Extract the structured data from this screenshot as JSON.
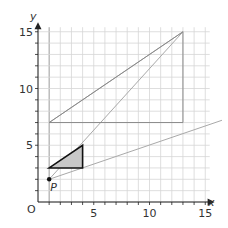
{
  "diagram": {
    "type": "coordinate-grid",
    "x_axis": {
      "label": "x",
      "min": 0,
      "max": 15,
      "ticks": [
        5,
        10,
        15
      ]
    },
    "y_axis": {
      "label": "y",
      "min": 0,
      "max": 15,
      "ticks": [
        5,
        10,
        15
      ]
    },
    "origin_label": "O",
    "point": {
      "label": "P",
      "x": 1,
      "y": 2
    },
    "shaded_triangle": [
      [
        1,
        3
      ],
      [
        4,
        3
      ],
      [
        4,
        5
      ]
    ],
    "large_triangle": [
      [
        1,
        7
      ],
      [
        13,
        7
      ],
      [
        13,
        15
      ]
    ],
    "ray_lines": [
      {
        "from": [
          1,
          2
        ],
        "to": [
          13,
          15
        ]
      },
      {
        "from": [
          1,
          2
        ],
        "to": [
          16.5,
          7.2
        ]
      },
      {
        "from": [
          1,
          7
        ],
        "to": [
          13,
          15
        ]
      }
    ],
    "colors": {
      "grid": "#d6d6d6",
      "axis": "#222222",
      "line": "#a9a9a9",
      "shade": "#c8c8c8",
      "outline": "#111111"
    }
  }
}
